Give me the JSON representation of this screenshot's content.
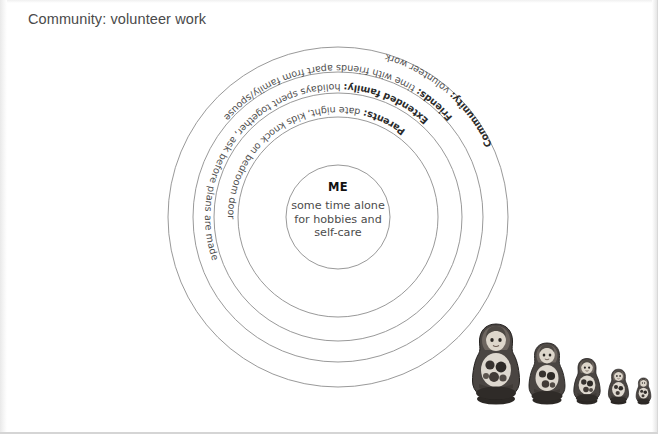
{
  "caption": "Community: volunteer work",
  "center": {
    "title": "ME",
    "body": "some time alone\nfor hobbies and\nself-care"
  },
  "rings": [
    {
      "id": "parents",
      "bold": "Parents:",
      "rest": " date night, kids knock on bedroom door"
    },
    {
      "id": "extended-family",
      "bold": "Extended family:",
      "rest": " holidays spent together, ask before plans are made"
    },
    {
      "id": "friends",
      "bold": "Friends:",
      "rest": " time with friends apart from family/spouse"
    },
    {
      "id": "community",
      "bold": "Community:",
      "rest": " volunteer work"
    }
  ],
  "dolls": {
    "label": "matryoshka nesting dolls",
    "count": 5
  },
  "colors": {
    "ring_stroke": "#8d8d8d",
    "text": "#4f4f4f",
    "bold_text": "#2b2b2b",
    "caption": "#4a4a4a",
    "doll_body": "#4a4542",
    "doll_face": "#d8d2c9"
  }
}
